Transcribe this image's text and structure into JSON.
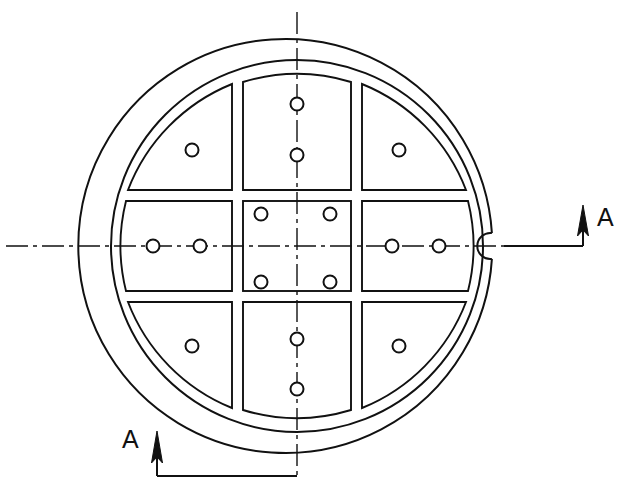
{
  "drawing": {
    "title": "Circular cover plate plan view",
    "type": "engineering-drawing",
    "view": "plan",
    "line_color": "#111111",
    "background_color": "#ffffff",
    "centerline_color": "#111111",
    "section_label": "A",
    "section_name": "A-A"
  },
  "annotations": {
    "section_arrow_right_label": "A",
    "section_arrow_bottom_label": "A"
  },
  "geometry": {
    "center": {
      "x": 297,
      "y": 246
    },
    "outer_circle": {
      "cx": 297,
      "cy": 246,
      "r": 207
    },
    "inner_circle": {
      "cx": 297,
      "cy": 246,
      "r": 186
    },
    "notch": {
      "cx": 491,
      "cy": 246,
      "r": 13,
      "shape": "semicircular-keyway"
    },
    "grid": {
      "rows": 3,
      "cols": 3,
      "panel_count": 9,
      "x_breaks": [
        120,
        238,
        356,
        474
      ],
      "y_breaks": [
        80,
        196,
        296,
        412
      ],
      "gap": 8
    },
    "holes": {
      "diameter_px": 13,
      "count": 16,
      "positions": [
        {
          "x": 192,
          "y": 150,
          "panel": "top-left"
        },
        {
          "x": 297,
          "y": 104,
          "panel": "top-center"
        },
        {
          "x": 297,
          "y": 155,
          "panel": "top-center"
        },
        {
          "x": 399,
          "y": 150,
          "panel": "top-right"
        },
        {
          "x": 153,
          "y": 246,
          "panel": "middle-left"
        },
        {
          "x": 200,
          "y": 246,
          "panel": "middle-left"
        },
        {
          "x": 261,
          "y": 214,
          "panel": "center"
        },
        {
          "x": 330,
          "y": 214,
          "panel": "center"
        },
        {
          "x": 261,
          "y": 282,
          "panel": "center"
        },
        {
          "x": 330,
          "y": 282,
          "panel": "center"
        },
        {
          "x": 392,
          "y": 246,
          "panel": "middle-right"
        },
        {
          "x": 439,
          "y": 246,
          "panel": "middle-right"
        },
        {
          "x": 192,
          "y": 346,
          "panel": "bottom-left"
        },
        {
          "x": 297,
          "y": 339,
          "panel": "bottom-center"
        },
        {
          "x": 297,
          "y": 389,
          "panel": "bottom-center"
        },
        {
          "x": 399,
          "y": 346,
          "panel": "bottom-right"
        }
      ]
    },
    "centerlines": {
      "horizontal": {
        "y": 246,
        "x1": 6,
        "x2": 556,
        "style": "dash-dot"
      },
      "vertical": {
        "x": 297,
        "y1": 12,
        "y2": 476,
        "style": "dash-dot"
      }
    },
    "section_marks": {
      "right": {
        "leader_from": {
          "x": 491,
          "y": 246
        },
        "leader_to": {
          "x": 583,
          "y": 246
        },
        "arrow_tip": {
          "x": 583,
          "y": 206
        },
        "label_pos": {
          "x": 597,
          "y": 205
        }
      },
      "bottom": {
        "leader_from": {
          "x": 297,
          "y": 476
        },
        "corner": {
          "x": 157,
          "y": 476
        },
        "arrow_tip": {
          "x": 157,
          "y": 432
        },
        "label_pos": {
          "x": 122,
          "y": 427
        }
      }
    }
  }
}
